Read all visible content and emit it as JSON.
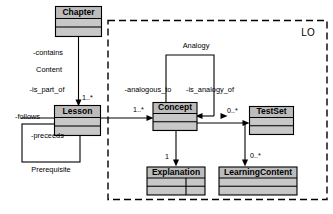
{
  "diagram": {
    "kind": "uml-class-diagram",
    "package": {
      "name": "LO",
      "border_style": "dashed"
    },
    "classes": [
      {
        "id": "chapter",
        "name": "Chapter",
        "fill": "#bcbcbc"
      },
      {
        "id": "lesson",
        "name": "Lesson",
        "fill": "#bcbcbc"
      },
      {
        "id": "concept",
        "name": "Concept",
        "fill": "#bcbcbc"
      },
      {
        "id": "testset",
        "name": "TestSet",
        "fill": "#bcbcbc"
      },
      {
        "id": "explanation",
        "name": "Explanation",
        "fill": "#bcbcbc"
      },
      {
        "id": "learningcontent",
        "name": "LearningContent",
        "fill": "#bcbcbc"
      }
    ],
    "association_classes": [
      {
        "id": "content",
        "name": "Content"
      },
      {
        "id": "prerequisite",
        "name": "Prerequisite"
      },
      {
        "id": "analogy",
        "name": "Analogy"
      }
    ],
    "role_labels": [
      {
        "id": "contains",
        "text": "-contains"
      },
      {
        "id": "is_part_of",
        "text": "-is_part_of"
      },
      {
        "id": "follows",
        "text": "-follows"
      },
      {
        "id": "preceeds",
        "text": "-preceeds"
      },
      {
        "id": "analogous_to",
        "text": "-analogous_to"
      },
      {
        "id": "is_analogy_of",
        "text": "-is_analogy_of"
      }
    ],
    "multiplicities": [
      {
        "id": "chapter-lesson",
        "text": "1..*"
      },
      {
        "id": "lesson-concept",
        "text": "1..*"
      },
      {
        "id": "concept-testset",
        "text": "0..*"
      },
      {
        "id": "concept-explanation",
        "text": "1"
      },
      {
        "id": "testset-learningcontent",
        "text": "0..*"
      }
    ]
  }
}
